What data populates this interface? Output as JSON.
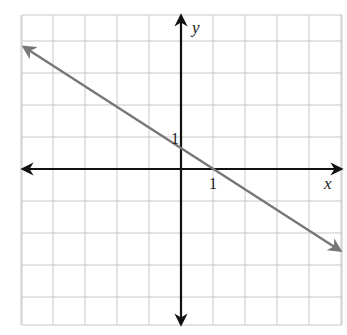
{
  "chart_data": {
    "type": "line",
    "title": "",
    "xlabel": "x",
    "ylabel": "y",
    "xlim": [
      -5,
      5
    ],
    "ylim": [
      -5,
      5
    ],
    "grid": true,
    "grid_step": 1,
    "tick_labels": {
      "x": [
        "1"
      ],
      "y": [
        "1"
      ]
    },
    "series": [
      {
        "name": "line",
        "equation": "y = -(2/3)x + 2/3",
        "slope": -0.667,
        "y_intercept": 0.667,
        "x_intercept": 1,
        "points": [
          [
            -5,
            4
          ],
          [
            5,
            -2.67
          ]
        ],
        "arrows_both_ends": true,
        "color": "#777777"
      }
    ],
    "axis_color": "#111111",
    "grid_color": "#c8c8c8"
  },
  "labels": {
    "x_axis": "x",
    "y_axis": "y",
    "x_tick_1": "1",
    "y_tick_1": "1"
  }
}
